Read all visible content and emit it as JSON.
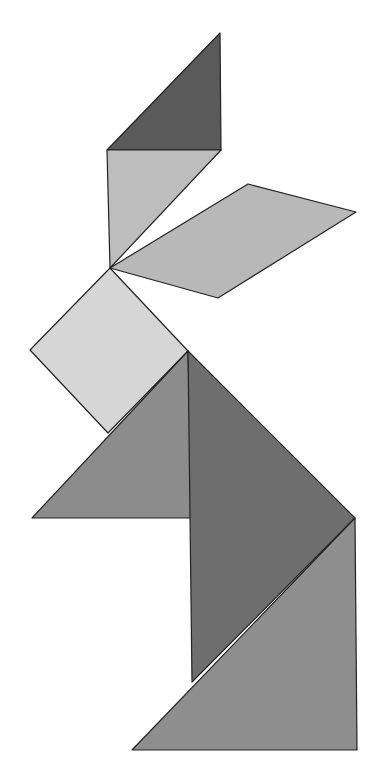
{
  "figure": {
    "title": "Tangram rabbit",
    "width": 385,
    "height": 777,
    "background": "#ffffff",
    "pieces": [
      {
        "id": "top-small-triangle",
        "name": "Small triangle (ear tip)",
        "points": "220,33 221,150 107,150",
        "fill": "#5a5a5a"
      },
      {
        "id": "left-ear-triangle",
        "name": "Triangle (left ear)",
        "points": "107,150 221,150 110,268",
        "fill": "#bdbdbd"
      },
      {
        "id": "right-ear-parallelogram",
        "name": "Parallelogram (right ear)",
        "points": "110,268 248,184 356,212 218,298",
        "fill": "#b8b8b8"
      },
      {
        "id": "head-square",
        "name": "Square (head)",
        "points": "110,268 188,351 108,433 30,350",
        "fill": "#d6d6d6"
      },
      {
        "id": "body-medium-triangle",
        "name": "Medium triangle (chest)",
        "points": "188,351 192,518 32,518",
        "fill": "#8c8c8c"
      },
      {
        "id": "body-large-triangle",
        "name": "Large triangle (body)",
        "points": "188,351 355,518 192,682",
        "fill": "#6e6e6e"
      },
      {
        "id": "base-large-triangle",
        "name": "Large triangle (base)",
        "points": "355,518 357,750 132,750",
        "fill": "#8e8e8e"
      }
    ]
  }
}
